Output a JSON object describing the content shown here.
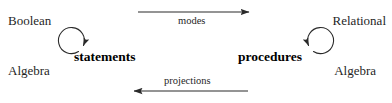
{
  "diagram": {
    "background_color": "#ffffff",
    "stroke_color": "#2a2a2a",
    "text_color": "#1f1f1f",
    "left_node": {
      "top_word": "Boolean",
      "bottom_word": "Algebra",
      "center_label": "statements",
      "self_loop": "clockwise-arc-arrow"
    },
    "right_node": {
      "top_word": "Relational",
      "bottom_word": "Algebra",
      "center_label": "procedures",
      "self_loop": "counterclockwise-arc-arrow"
    },
    "edges": [
      {
        "label": "modes",
        "direction": "left-to-right",
        "position": "top",
        "label_position": "below-line"
      },
      {
        "label": "projections",
        "direction": "right-to-left",
        "position": "bottom",
        "label_position": "above-line"
      }
    ]
  }
}
